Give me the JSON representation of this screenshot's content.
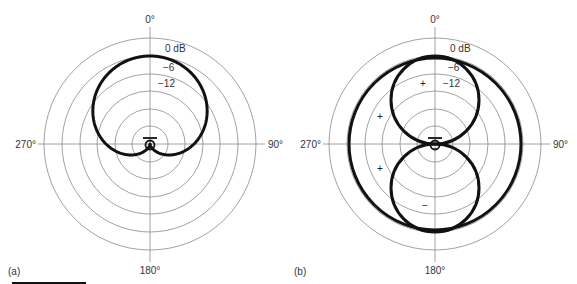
{
  "figure": {
    "panels": [
      {
        "id": "a",
        "label": "(a)",
        "pattern_name": "cardioid",
        "center": [
          150,
          144
        ],
        "axis_labels": {
          "top": "0°",
          "right": "90°",
          "bottom": "180°",
          "left": "270°"
        },
        "db_labels": [
          "0 dB",
          "−6",
          "−12"
        ],
        "sign_marks": []
      },
      {
        "id": "b",
        "label": "(b)",
        "pattern_name": "omnidirectional-and-figure-eight",
        "center": [
          435,
          144
        ],
        "axis_labels": {
          "top": "0°",
          "right": "90°",
          "bottom": "180°",
          "left": "270°"
        },
        "db_labels": [
          "0 dB",
          "−6",
          "−12"
        ],
        "sign_marks": [
          {
            "text": "+",
            "x": 423,
            "y": 87
          },
          {
            "text": "+",
            "x": 380,
            "y": 120
          },
          {
            "text": "+",
            "x": 380,
            "y": 172
          },
          {
            "text": "−",
            "x": 425,
            "y": 209
          }
        ]
      }
    ],
    "colors": {
      "grid": "#8a8a8a",
      "pattern": "#111111",
      "text": "#333333"
    }
  },
  "chart_data": [
    {
      "type": "polar",
      "title": "(a) Cardioid polar pattern",
      "angular_ticks": [
        "0°",
        "90°",
        "180°",
        "270°"
      ],
      "radial_labels": [
        "0 dB",
        "−6",
        "−12"
      ],
      "grid_rings": 6,
      "series": [
        {
          "name": "cardioid",
          "formula": "0.5*(1+cos(theta))",
          "null_at": "180°",
          "max_at": "0°",
          "max_db": 0
        }
      ]
    },
    {
      "type": "polar",
      "title": "(b) Omnidirectional and figure-eight polar patterns",
      "angular_ticks": [
        "0°",
        "90°",
        "180°",
        "270°"
      ],
      "radial_labels": [
        "0 dB",
        "−6",
        "−12"
      ],
      "grid_rings": 6,
      "series": [
        {
          "name": "omnidirectional",
          "formula": "1",
          "max_db": 0,
          "polarity": "+"
        },
        {
          "name": "figure-eight",
          "formula": "|cos(theta)|",
          "front_lobe_polarity": "+",
          "rear_lobe_polarity": "−",
          "nulls_at": [
            "90°",
            "270°"
          ]
        }
      ]
    }
  ]
}
